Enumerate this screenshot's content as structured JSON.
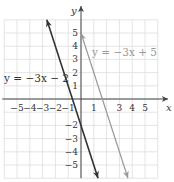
{
  "chart_data": {
    "type": "line",
    "title": "",
    "xlabel": "x",
    "ylabel": "y",
    "xlim": [
      -6,
      6
    ],
    "ylim": [
      -6,
      6
    ],
    "grid": true,
    "x_ticks": [
      -5,
      -4,
      -3,
      -2,
      -1,
      1,
      3,
      4,
      5
    ],
    "y_ticks": [
      5,
      4,
      3,
      2,
      1,
      -2,
      -3,
      -4,
      -5
    ],
    "series": [
      {
        "name": "y = −3x − 2",
        "slope": -3,
        "intercept": -2,
        "points": [
          [
            -2.67,
            6
          ],
          [
            1.33,
            -6
          ]
        ],
        "color": "#333333",
        "label_text": "y = −3x − 2",
        "label_position": "left"
      },
      {
        "name": "y = −3x + 5",
        "slope": -3,
        "intercept": 5,
        "points": [
          [
            0,
            5
          ],
          [
            3.67,
            -6
          ]
        ],
        "color": "#999999",
        "label_text": "y = −3x + 5",
        "label_position": "upper-right"
      }
    ]
  }
}
